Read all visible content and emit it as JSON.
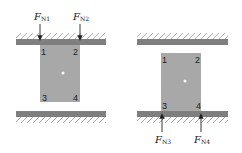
{
  "colors": {
    "block": "#a8a8a8",
    "wall": "#7f7f7f",
    "hatch": "#9a9a9a",
    "arrow": "#222222",
    "center_dot": "#ffffff"
  },
  "left_panel": {
    "forces": [
      {
        "symbol": "F",
        "subscript": "N1",
        "direction": "down",
        "corner": "1"
      },
      {
        "symbol": "F",
        "subscript": "N2",
        "direction": "down",
        "corner": "2"
      }
    ],
    "corners": [
      "1",
      "2",
      "3",
      "4"
    ],
    "contact": "top wall"
  },
  "right_panel": {
    "forces": [
      {
        "symbol": "F",
        "subscript": "N3",
        "direction": "up",
        "corner": "3"
      },
      {
        "symbol": "F",
        "subscript": "N4",
        "direction": "up",
        "corner": "4"
      }
    ],
    "corners": [
      "1",
      "2",
      "3",
      "4"
    ],
    "contact": "bottom wall"
  }
}
